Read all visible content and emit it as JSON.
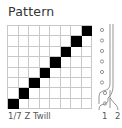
{
  "title": "Pattern",
  "caption": "1/7 Z Twill",
  "grid": {
    "rows": 8,
    "cols": 8,
    "filled_cells": [
      {
        "row": 0,
        "col": 7
      },
      {
        "row": 1,
        "col": 6
      },
      {
        "row": 2,
        "col": 5
      },
      {
        "row": 3,
        "col": 4
      },
      {
        "row": 4,
        "col": 3
      },
      {
        "row": 5,
        "col": 2
      },
      {
        "row": 6,
        "col": 1
      },
      {
        "row": 7,
        "col": 0
      }
    ],
    "filled_color": "#000000",
    "line_color": "#c8c8c8"
  },
  "threading": {
    "shaft_labels": [
      "1",
      "2"
    ],
    "heddle_count": 8
  }
}
